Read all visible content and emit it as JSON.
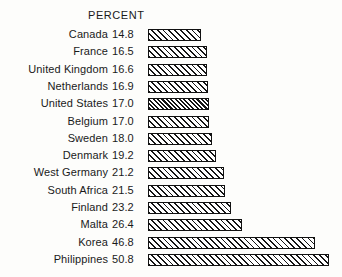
{
  "chart_data": {
    "type": "bar",
    "orientation": "horizontal",
    "title": "",
    "column_header": "PERCENT",
    "xlabel": "",
    "ylabel": "",
    "value_unit": "percent",
    "value_labels_shown": true,
    "axis_shown": false,
    "grid": false,
    "legend": false,
    "xlim": [
      0,
      50.8
    ],
    "categories": [
      "Canada",
      "France",
      "United Kingdom",
      "Netherlands",
      "United States",
      "Belgium",
      "Sweden",
      "Denmark",
      "West Germany",
      "South Africa",
      "Finland",
      "Malta",
      "Korea",
      "Philippines"
    ],
    "values": [
      14.8,
      16.5,
      16.6,
      16.9,
      17.0,
      17.0,
      18.0,
      19.2,
      21.2,
      21.5,
      23.2,
      26.4,
      46.8,
      50.8
    ],
    "value_text": [
      "14.8",
      "16.5",
      "16.6",
      "16.9",
      "17.0",
      "17.0",
      "18.0",
      "19.2",
      "21.2",
      "21.5",
      "23.2",
      "26.4",
      "46.8",
      "50.8"
    ],
    "highlighted_category": "United States",
    "bars": [
      {
        "label": "Canada",
        "value": 14.8,
        "value_text": "14.8",
        "highlighted": false
      },
      {
        "label": "France",
        "value": 16.5,
        "value_text": "16.5",
        "highlighted": false
      },
      {
        "label": "United Kingdom",
        "value": 16.6,
        "value_text": "16.6",
        "highlighted": false
      },
      {
        "label": "Netherlands",
        "value": 16.9,
        "value_text": "16.9",
        "highlighted": false
      },
      {
        "label": "United States",
        "value": 17.0,
        "value_text": "17.0",
        "highlighted": true
      },
      {
        "label": "Belgium",
        "value": 17.0,
        "value_text": "17.0",
        "highlighted": false
      },
      {
        "label": "Sweden",
        "value": 18.0,
        "value_text": "18.0",
        "highlighted": false
      },
      {
        "label": "Denmark",
        "value": 19.2,
        "value_text": "19.2",
        "highlighted": false
      },
      {
        "label": "West Germany",
        "value": 21.2,
        "value_text": "21.2",
        "highlighted": false
      },
      {
        "label": "South Africa",
        "value": 21.5,
        "value_text": "21.5",
        "highlighted": false
      },
      {
        "label": "Finland",
        "value": 23.2,
        "value_text": "23.2",
        "highlighted": false
      },
      {
        "label": "Malta",
        "value": 26.4,
        "value_text": "26.4",
        "highlighted": false
      },
      {
        "label": "Korea",
        "value": 46.8,
        "value_text": "46.8",
        "highlighted": false
      },
      {
        "label": "Philippines",
        "value": 50.8,
        "value_text": "50.8",
        "highlighted": false
      }
    ],
    "colors": {
      "background": "#fdfdfb",
      "text": "#1a1a1a",
      "bar_outline": "#111111",
      "bar_fill": "#ffffff",
      "bar_hatch": "#151515"
    },
    "layout": {
      "bar_origin_x": 148,
      "px_per_unit": 3.565,
      "row_pitch": 17.3,
      "first_row_top": 28,
      "bar_height": 12
    }
  }
}
